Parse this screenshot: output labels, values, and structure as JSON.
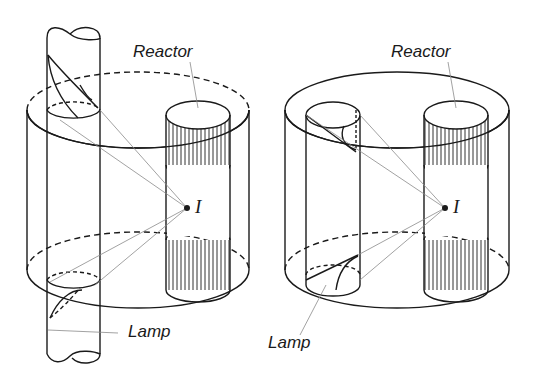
{
  "figure": {
    "panels": [
      {
        "id": "left",
        "description": "Lamp passing vertically through the photoreactor, outside the reactor vessel wall",
        "labels": {
          "reactor": "Reactor",
          "lamp": "Lamp",
          "point": "I"
        }
      },
      {
        "id": "right",
        "description": "Lamp contained within the photoreactor cylinder",
        "labels": {
          "reactor": "Reactor",
          "lamp": "Lamp",
          "point": "I"
        }
      }
    ],
    "colors": {
      "ink": "#1a1a1a",
      "ray": "#8a8a8a",
      "background": "#ffffff"
    }
  }
}
